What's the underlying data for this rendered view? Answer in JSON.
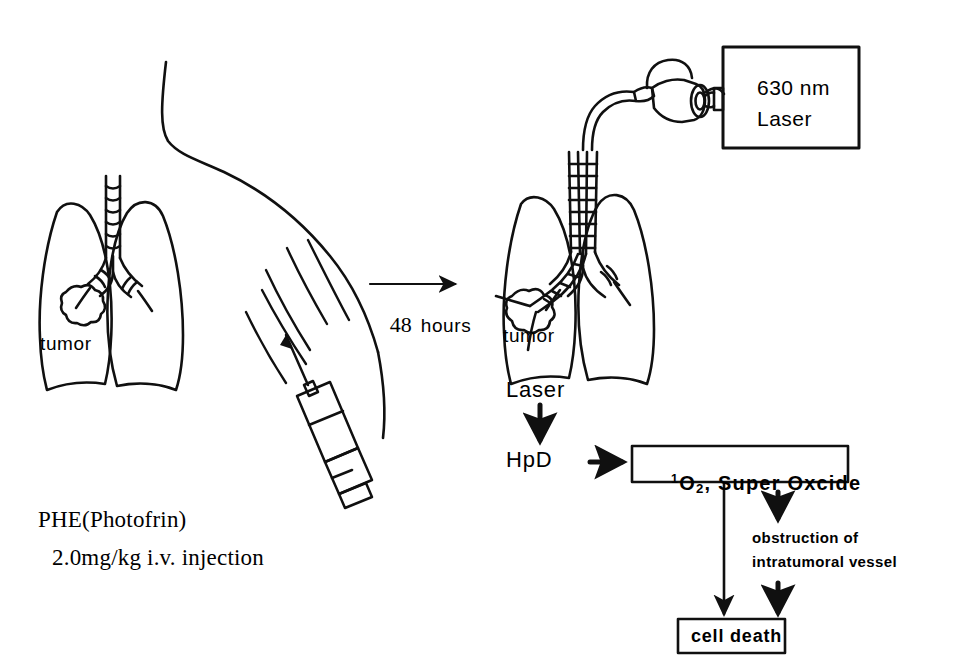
{
  "figure": {
    "stroke_color": "#101010",
    "background_color": "#ffffff"
  },
  "left_panel": {
    "tumor_label": "tumor",
    "drug_line1": "PHE(Photofrin)",
    "drug_line2": "2.0mg/kg i.v. injection",
    "syringe_name": "syringe",
    "body_name": "patient-body-outline"
  },
  "transition": {
    "arrow_label_time": "48",
    "arrow_label_unit": "hours"
  },
  "right_panel": {
    "tumor_label": "tumor",
    "laser_box_line1": "630 nm",
    "laser_box_line2": "Laser",
    "scope_name": "bronchoscope"
  },
  "flow": {
    "laser": "Laser",
    "hpd": "HpD",
    "ros_prefix": "1",
    "ros_element": "O",
    "ros_sub": "2",
    "ros_rest": ", Super Oxcide",
    "ros_full": "¹O₂, Super Oxcide",
    "obstruction_line1": "obstruction of",
    "obstruction_line2": "intratumoral vessel",
    "cell_death": "cell death"
  }
}
